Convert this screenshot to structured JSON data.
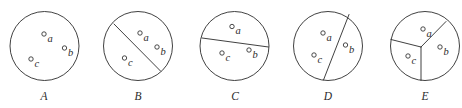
{
  "figure": {
    "background_color": "#ffffff",
    "stroke_color": "#2b2b2b",
    "point_fill_color": "#ffffff",
    "width": 462,
    "height": 108,
    "caption_baseline_y": 100,
    "circle_center_y": 46,
    "circle_radius": 34.5,
    "point_marker_radius": 2.2,
    "panels": [
      {
        "caption": "A",
        "caption_x": 44,
        "center_x": 44.5,
        "region_count": 1,
        "description": "circle with no dividing lines; all three points in one region",
        "dividers": [],
        "points": [
          {
            "label": "a",
            "x": 44.0,
            "y": 34.0,
            "label_x": 47.5,
            "label_y": 41.5
          },
          {
            "label": "b",
            "x": 64.5,
            "y": 48.0,
            "label_x": 68.0,
            "label_y": 55.5
          },
          {
            "label": "c",
            "x": 31.0,
            "y": 59.0,
            "label_x": 34.5,
            "label_y": 66.5
          }
        ]
      },
      {
        "caption": "B",
        "caption_x": 138,
        "center_x": 138.0,
        "region_count": 2,
        "description": "one diagonal chord from upper-left to lower-right separating c from a and b",
        "dividers": [
          {
            "type": "chord",
            "x1": 114.0,
            "y1": 24.0,
            "x2": 160.5,
            "y2": 71.0
          }
        ],
        "points": [
          {
            "label": "a",
            "x": 140.0,
            "y": 33.0,
            "label_x": 143.5,
            "label_y": 40.5
          },
          {
            "label": "b",
            "x": 157.0,
            "y": 47.0,
            "label_x": 160.5,
            "label_y": 54.5
          },
          {
            "label": "c",
            "x": 124.5,
            "y": 58.0,
            "label_x": 128.0,
            "label_y": 65.5
          }
        ]
      },
      {
        "caption": "C",
        "caption_x": 235,
        "center_x": 234.5,
        "region_count": 2,
        "description": "one near-horizontal chord tilted slightly down to the right; a above, b and c below",
        "dividers": [
          {
            "type": "chord",
            "x1": 202.0,
            "y1": 38.0,
            "x2": 268.5,
            "y2": 47.0
          }
        ],
        "points": [
          {
            "label": "a",
            "x": 232.0,
            "y": 26.5,
            "label_x": 235.5,
            "label_y": 34.0
          },
          {
            "label": "b",
            "x": 249.0,
            "y": 50.0,
            "label_x": 252.5,
            "label_y": 57.5
          },
          {
            "label": "c",
            "x": 222.0,
            "y": 53.0,
            "label_x": 225.5,
            "label_y": 60.5
          }
        ]
      },
      {
        "caption": "D",
        "caption_x": 328,
        "center_x": 328.0,
        "region_count": 2,
        "description": "one steep near-vertical chord from upper-right to bottom-center; b on the right, a and c on the left",
        "dividers": [
          {
            "type": "chord",
            "x1": 349.0,
            "y1": 14.5,
            "x2": 323.5,
            "y2": 80.0
          }
        ],
        "points": [
          {
            "label": "a",
            "x": 323.0,
            "y": 33.0,
            "label_x": 326.5,
            "label_y": 40.5
          },
          {
            "label": "b",
            "x": 345.5,
            "y": 45.0,
            "label_x": 349.0,
            "label_y": 52.5
          },
          {
            "label": "c",
            "x": 314.0,
            "y": 55.0,
            "label_x": 317.5,
            "label_y": 62.5
          }
        ]
      },
      {
        "caption": "E",
        "caption_x": 425,
        "center_x": 425.0,
        "region_count": 3,
        "description": "three-way Y partition from an interior junction; each point in its own region",
        "dividers": [
          {
            "type": "spoke",
            "x1": 421.0,
            "y1": 47.0,
            "x2": 446.0,
            "y2": 21.5
          },
          {
            "type": "spoke",
            "x1": 421.0,
            "y1": 47.0,
            "x2": 391.0,
            "y2": 39.5
          },
          {
            "type": "spoke",
            "x1": 421.0,
            "y1": 47.0,
            "x2": 421.0,
            "y2": 80.5
          }
        ],
        "points": [
          {
            "label": "a",
            "x": 423.0,
            "y": 29.0,
            "label_x": 426.5,
            "label_y": 36.5
          },
          {
            "label": "b",
            "x": 440.0,
            "y": 47.0,
            "label_x": 443.5,
            "label_y": 54.5
          },
          {
            "label": "c",
            "x": 408.0,
            "y": 56.0,
            "label_x": 411.5,
            "label_y": 63.5
          }
        ]
      }
    ]
  }
}
